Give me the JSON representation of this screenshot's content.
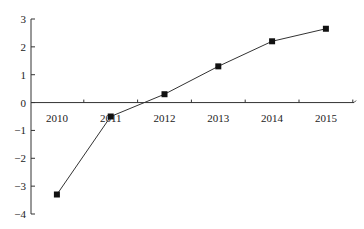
{
  "chart_data": {
    "type": "line",
    "title": "",
    "xlabel": "",
    "ylabel": "",
    "categories": [
      "2010",
      "2011",
      "2012",
      "2013",
      "2014",
      "2015"
    ],
    "series": [
      {
        "name": "series",
        "values": [
          -3.3,
          -0.5,
          0.3,
          1.3,
          2.2,
          2.65
        ],
        "marker": "square"
      }
    ],
    "ylim": [
      -4,
      3
    ],
    "yticks": [
      "3",
      "2",
      "1",
      "0",
      "−1",
      "−2",
      "−3",
      "−4"
    ],
    "ytick_values": [
      3,
      2,
      1,
      0,
      -1,
      -2,
      -3,
      -4
    ],
    "grid": false,
    "legend": "none",
    "colors": {
      "line": "#333333",
      "marker": "#111111",
      "axis": "#333333"
    }
  }
}
